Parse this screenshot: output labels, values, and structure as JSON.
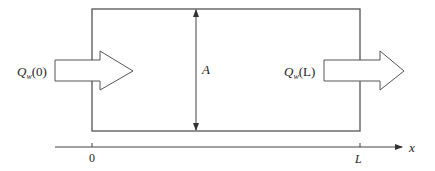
{
  "diagram": {
    "inflow_label": {
      "symbol": "Q",
      "subscript": "w",
      "argument": "(0)"
    },
    "outflow_label": {
      "symbol": "Q",
      "subscript": "w",
      "argument": "(L)"
    },
    "area_label": "A",
    "axis": {
      "label": "x",
      "ticks": [
        "0",
        "L"
      ]
    },
    "colors": {
      "stroke": "#444444",
      "background": "#ffffff"
    }
  }
}
